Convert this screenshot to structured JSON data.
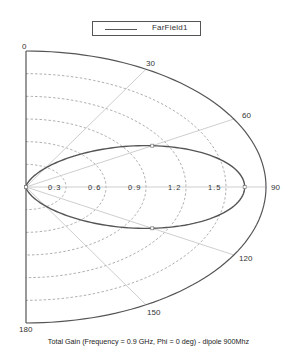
{
  "chart_data": {
    "type": "polar",
    "title": "",
    "caption": "Total Gain (Frequency = 0.9 GHz, Phi = 0 deg) - dipole 900Mhz",
    "legend": [
      {
        "name": "FarField1",
        "color": "#555555"
      }
    ],
    "angle_unit": "deg",
    "angle_ticks": [
      0,
      30,
      60,
      90,
      120,
      150,
      180
    ],
    "angle_range": [
      0,
      180
    ],
    "radial_ticks": [
      0.3,
      0.6,
      0.9,
      1.2,
      1.5
    ],
    "radial_range": [
      0,
      1.8
    ],
    "grid": true,
    "legend_position": "top-center",
    "series": [
      {
        "name": "FarField1",
        "theta_deg": [
          0,
          10,
          20,
          30,
          40,
          50,
          60,
          70,
          80,
          90,
          100,
          110,
          120,
          130,
          140,
          150,
          160,
          170,
          180
        ],
        "values": [
          0.0,
          0.01,
          0.05,
          0.21,
          0.45,
          0.76,
          1.05,
          1.33,
          1.53,
          1.64,
          1.53,
          1.33,
          1.05,
          0.76,
          0.45,
          0.21,
          0.05,
          0.01,
          0.0
        ],
        "markers_at_deg": [
          0,
          60,
          90,
          120,
          180
        ]
      }
    ]
  },
  "legend": {
    "label": "FarField1"
  },
  "caption": "Total Gain (Frequency = 0.9 GHz, Phi = 0 deg) - dipole 900Mhz"
}
